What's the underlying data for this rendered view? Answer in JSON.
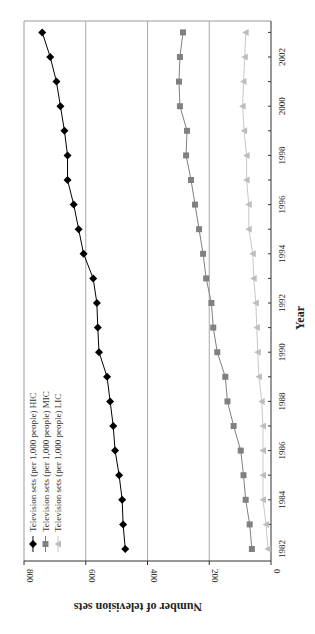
{
  "chart_data": {
    "type": "line",
    "orientation_note": "rotated 90 degrees clockwise in the image",
    "title": "",
    "xlabel": "Year",
    "ylabel": "Number of television sets",
    "x": [
      1982,
      1983,
      1984,
      1985,
      1986,
      1987,
      1988,
      1989,
      1990,
      1991,
      1992,
      1993,
      1994,
      1995,
      1996,
      1997,
      1998,
      1999,
      2000,
      2001,
      2002,
      2003
    ],
    "x_ticks": [
      1982,
      1984,
      1986,
      1988,
      1990,
      1992,
      1994,
      1996,
      1998,
      2000,
      2002
    ],
    "y_ticks": [
      0,
      200,
      400,
      600,
      800
    ],
    "ylim": [
      0,
      800
    ],
    "grid": "horizontal gridlines at 200, 400, 600",
    "legend_position": "upper-left (bottom-left of rotated image)",
    "series": [
      {
        "name": "Television sets (per 1,000 people) HIC",
        "marker": "diamond",
        "color": "#000000",
        "values": [
          472,
          479,
          482,
          492,
          505,
          511,
          521,
          531,
          557,
          561,
          564,
          576,
          607,
          623,
          639,
          659,
          659,
          669,
          682,
          695,
          715,
          741
        ]
      },
      {
        "name": "Television sets (per 1,000 people) MIC",
        "marker": "square",
        "color": "#808080",
        "values": [
          62,
          69,
          82,
          89,
          98,
          121,
          141,
          148,
          174,
          187,
          193,
          210,
          220,
          233,
          246,
          259,
          275,
          272,
          295,
          298,
          295,
          285
        ]
      },
      {
        "name": "Television sets (per 1,000 people) LIC",
        "marker": "triangle",
        "color": "#bdbdbd",
        "values": [
          10,
          16,
          26,
          26,
          26,
          26,
          30,
          39,
          43,
          46,
          49,
          56,
          59,
          72,
          72,
          79,
          79,
          87,
          92,
          89,
          85,
          82
        ]
      }
    ]
  }
}
